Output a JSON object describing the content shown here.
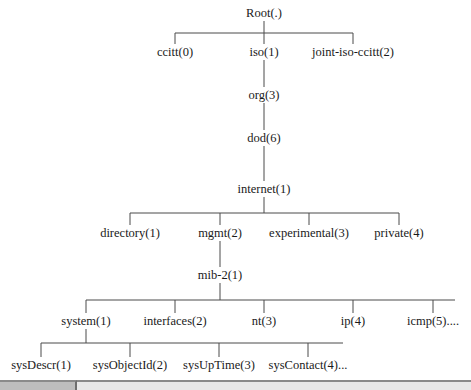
{
  "diagram": {
    "line_color": "#4a4a4a",
    "nodes": {
      "root": {
        "label": "Root(.)",
        "x": 264,
        "y": 13
      },
      "ccitt": {
        "label": "ccitt(0)",
        "x": 175,
        "y": 52
      },
      "iso": {
        "label": "iso(1)",
        "x": 264,
        "y": 52
      },
      "joint": {
        "label": "joint-iso-ccitt(2)",
        "x": 353,
        "y": 52
      },
      "org": {
        "label": "org(3)",
        "x": 264,
        "y": 95
      },
      "dod": {
        "label": "dod(6)",
        "x": 264,
        "y": 138
      },
      "internet": {
        "label": "internet(1)",
        "x": 264,
        "y": 189
      },
      "directory": {
        "label": "directory(1)",
        "x": 130,
        "y": 233
      },
      "mgmt": {
        "label": "mgmt(2)",
        "x": 220,
        "y": 233
      },
      "experimental": {
        "label": "experimental(3)",
        "x": 309,
        "y": 233
      },
      "private": {
        "label": "private(4)",
        "x": 399,
        "y": 233
      },
      "mib2": {
        "label": "mib-2(1)",
        "x": 220,
        "y": 275
      },
      "system": {
        "label": "system(1)",
        "x": 86,
        "y": 321
      },
      "interfaces": {
        "label": "interfaces(2)",
        "x": 175,
        "y": 321
      },
      "nt": {
        "label": "nt(3)",
        "x": 264,
        "y": 321
      },
      "ip": {
        "label": "ip(4)",
        "x": 353,
        "y": 321
      },
      "icmp": {
        "label": "icmp(5)....",
        "x": 433,
        "y": 321
      },
      "sysDescr": {
        "label": "sysDescr(1)",
        "x": 41,
        "y": 365
      },
      "sysObjectId": {
        "label": "sysObjectId(2)",
        "x": 130,
        "y": 365
      },
      "sysUpTime": {
        "label": "sysUpTime(3)",
        "x": 219,
        "y": 365
      },
      "sysContact": {
        "label": "sysContact(4)...",
        "x": 308,
        "y": 365
      }
    },
    "edges": [
      {
        "from": "root",
        "to": [
          "ccitt",
          "iso",
          "joint"
        ]
      },
      {
        "from": "iso",
        "to": [
          "org"
        ]
      },
      {
        "from": "org",
        "to": [
          "dod"
        ]
      },
      {
        "from": "dod",
        "to": [
          "internet"
        ]
      },
      {
        "from": "internet",
        "to": [
          "directory",
          "mgmt",
          "experimental",
          "private"
        ]
      },
      {
        "from": "mgmt",
        "to": [
          "mib2"
        ]
      },
      {
        "from": "mib2",
        "to": [
          "system",
          "interfaces",
          "nt",
          "ip",
          "icmp"
        ]
      },
      {
        "from": "system",
        "to": [
          "sysDescr",
          "sysObjectId",
          "sysUpTime",
          "sysContact"
        ]
      }
    ]
  }
}
